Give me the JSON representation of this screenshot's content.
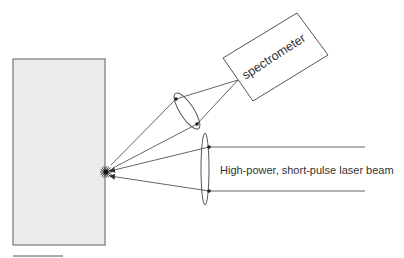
{
  "diagram": {
    "title": "",
    "labels": {
      "spectrometer": "spectrometer",
      "laser_beam": "High-power, short-pulse laser beam"
    },
    "colors": {
      "line": "#555555",
      "sample_fill": "#ececec",
      "sample_border": "#777777",
      "text": "#333333",
      "background": "#ffffff"
    },
    "components": [
      {
        "id": "sample",
        "kind": "sample-block"
      },
      {
        "id": "plasma-spark",
        "kind": "spark"
      },
      {
        "id": "collection-lens",
        "kind": "lens"
      },
      {
        "id": "spectrometer",
        "kind": "box",
        "label": "spectrometer"
      },
      {
        "id": "focusing-lens",
        "kind": "lens"
      },
      {
        "id": "laser-beam",
        "kind": "beam",
        "label": "High-power, short-pulse laser beam"
      }
    ]
  }
}
